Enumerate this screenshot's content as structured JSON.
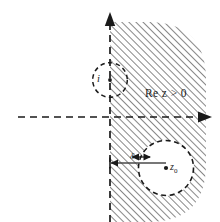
{
  "figure": {
    "type": "complex-plane-diagram",
    "width": 220,
    "height": 222,
    "colors": {
      "ink": "#1a1a1a",
      "hatch": "#3a3a3a",
      "background": "#ffffff"
    }
  },
  "axes": {
    "imaginary_axis": {
      "label": "imaginary-axis",
      "style": "dashed",
      "x": 110,
      "y_top": 14,
      "y_bottom": 222,
      "arrow": "up"
    },
    "real_axis": {
      "label": "real-axis",
      "style": "dashed",
      "y": 117,
      "x_left": 18,
      "x_right": 206,
      "arrow": "right"
    },
    "origin": {
      "x": 110,
      "y": 117
    }
  },
  "region": {
    "name": "half-plane-region",
    "label": "Re z > 0",
    "fill": "diagonal-hatch",
    "hatch_angle_deg": 45,
    "hatch_spacing_px": 5,
    "left_edge_x": 110,
    "top_y": 22,
    "bottom_y": 222,
    "right_x": 206,
    "corner_radius_px": 58
  },
  "markers": [
    {
      "name": "point-i",
      "label": "i",
      "cx": 110,
      "cy": 80,
      "circle_radius": 18,
      "circle_style": "dashed",
      "circle_fill": "none",
      "note": "small dashed disc centred on the imaginary axis at i; left half unhatched"
    },
    {
      "name": "point-z0",
      "label": "z",
      "sublabel": "0",
      "cx": 166,
      "cy": 168,
      "circle_radius": 28,
      "circle_style": "dashed",
      "circle_fill": "white",
      "note": "dashed disc of radius delta-neighbourhood around z0, excluded from hatching"
    }
  ],
  "annotations": {
    "distance": {
      "name": "delta-measure",
      "label": "δ",
      "from_x": 110,
      "to_x": 138,
      "y": 163,
      "arrow_y": 158,
      "arrow_from_x": 133,
      "arrow_to_x": 150,
      "description": "double arrow marking the distance delta from the imaginary axis to the disc"
    },
    "region_label": {
      "name": "region-label",
      "text": "Re z > 0"
    }
  },
  "labels": {
    "re_z_gt_0": "Re z > 0",
    "i": "i",
    "delta": "δ",
    "z0_base": "z",
    "z0_sub": "0"
  }
}
